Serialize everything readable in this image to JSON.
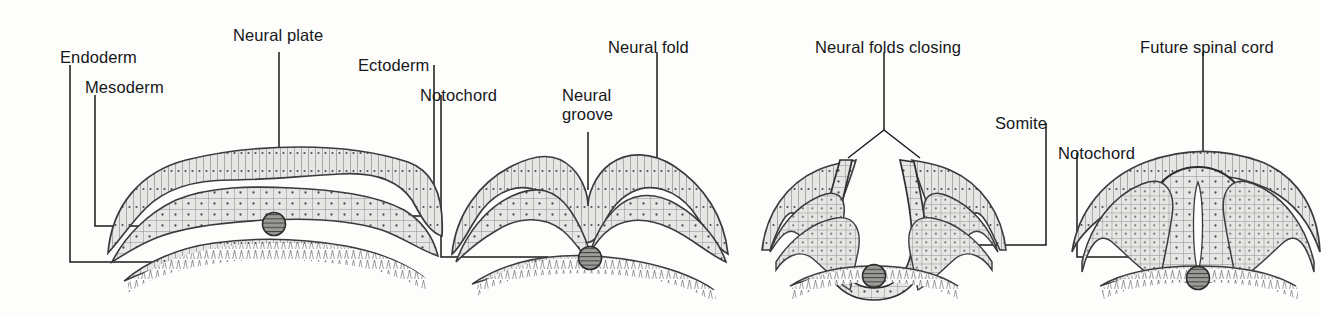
{
  "figure": {
    "background_color": "#fdfdfb",
    "ink_color": "#16181a",
    "cell_fill_color": "#e3e3e1",
    "cell_outline_color": "#4a4a4a",
    "notochord_fill_color": "#8e8e8a",
    "leader_color": "#1a1a1a"
  },
  "labels": [
    {
      "id": "endoderm",
      "text": "Endoderm",
      "x": 60,
      "y": 59
    },
    {
      "id": "mesoderm",
      "text": "Mesoderm",
      "x": 85,
      "y": 89
    },
    {
      "id": "neural-plate",
      "text": "Neural plate",
      "x": 233,
      "y": 30
    },
    {
      "id": "ectoderm",
      "text": "Ectoderm",
      "x": 358,
      "y": 59
    },
    {
      "id": "notochord-1",
      "text": "Notochord",
      "x": 420,
      "y": 89
    },
    {
      "id": "neural-groove",
      "text": "Neural\ngroove",
      "x": 560,
      "y": 89
    },
    {
      "id": "neural-fold",
      "text": "Neural fold",
      "x": 608,
      "y": 41
    },
    {
      "id": "neural-folds-closing",
      "text": "Neural folds closing",
      "x": 815,
      "y": 41
    },
    {
      "id": "somite",
      "text": "Somite",
      "x": 995,
      "y": 117
    },
    {
      "id": "notochord-2",
      "text": "Notochord",
      "x": 1058,
      "y": 147
    },
    {
      "id": "future-spinal-cord",
      "text": "Future spinal cord",
      "x": 1140,
      "y": 41
    }
  ],
  "stages": [
    {
      "id": "stage-1",
      "name": "neural-plate-stage",
      "caption": "Flat neural plate; ectoderm, mesoderm and endoderm layers with notochord",
      "structures": [
        "ectoderm",
        "neural plate",
        "mesoderm",
        "notochord",
        "endoderm"
      ]
    },
    {
      "id": "stage-2",
      "name": "neural-groove-stage",
      "caption": "Neural plate folds inward forming the neural groove flanked by neural folds",
      "structures": [
        "neural fold",
        "neural groove",
        "notochord",
        "endoderm"
      ]
    },
    {
      "id": "stage-3",
      "name": "neural-folds-closing-stage",
      "caption": "Neural folds rise and converge toward the midline; somites appear laterally",
      "structures": [
        "neural folds closing",
        "somite",
        "notochord"
      ]
    },
    {
      "id": "stage-4",
      "name": "neural-tube-stage",
      "caption": "Neural tube closed beneath the ectoderm; becomes the future spinal cord",
      "structures": [
        "future spinal cord",
        "notochord",
        "somite"
      ]
    }
  ],
  "leaders": [
    {
      "id": "leader-endoderm",
      "target_stage": "stage-1",
      "target_structure": "endoderm"
    },
    {
      "id": "leader-mesoderm",
      "target_stage": "stage-1",
      "target_structure": "mesoderm"
    },
    {
      "id": "leader-neural-plate",
      "target_stage": "stage-1",
      "target_structure": "neural plate"
    },
    {
      "id": "leader-ectoderm",
      "target_stage": "stage-1",
      "target_structure": "ectoderm"
    },
    {
      "id": "leader-notochord-1",
      "target_stage": "stage-2",
      "target_structure": "notochord"
    },
    {
      "id": "leader-neural-groove",
      "target_stage": "stage-2",
      "target_structure": "neural groove"
    },
    {
      "id": "leader-neural-fold",
      "target_stage": "stage-2",
      "target_structure": "neural fold"
    },
    {
      "id": "leader-neural-folds-closing",
      "target_stage": "stage-3",
      "target_structure": "neural folds closing"
    },
    {
      "id": "leader-somite",
      "target_stage": "stage-3",
      "target_structure": "somite"
    },
    {
      "id": "leader-notochord-2",
      "target_stage": "stage-4",
      "target_structure": "notochord"
    },
    {
      "id": "leader-future-spinal-cord",
      "target_stage": "stage-4",
      "target_structure": "future spinal cord"
    }
  ]
}
